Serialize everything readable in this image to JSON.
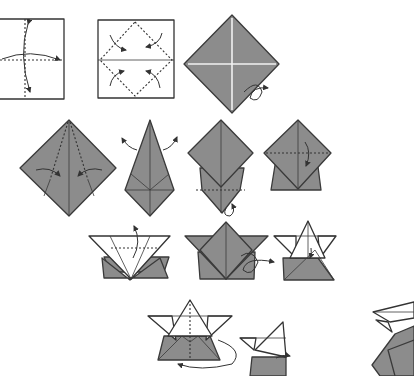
{
  "diagram": {
    "title": "",
    "colors": {
      "paper_front": "#8c8c8c",
      "paper_back": "#ffffff",
      "line": "#333333"
    },
    "steps": [
      {
        "id": 1,
        "shape": "square",
        "description": "Valley fold in half both ways and unfold",
        "symbols": [
          "valley-fold-line",
          "fold-unfold-arrow"
        ]
      },
      {
        "id": 2,
        "shape": "square",
        "description": "Fold four corners to center",
        "symbols": [
          "valley-fold-line",
          "fold-arrow"
        ]
      },
      {
        "id": 3,
        "shape": "diamond",
        "description": "Turn over",
        "symbols": [
          "turn-over-arrow"
        ]
      },
      {
        "id": 4,
        "shape": "diamond",
        "description": "Fold edges to center line",
        "symbols": [
          "valley-fold-line",
          "fold-arrow"
        ]
      },
      {
        "id": 5,
        "shape": "kite",
        "description": "Unfold flaps",
        "symbols": [
          "unfold-arrow"
        ]
      },
      {
        "id": 6,
        "shape": "diamond-stack",
        "description": "Turn over",
        "symbols": [
          "valley-fold-line",
          "turn-over-arrow"
        ]
      },
      {
        "id": 7,
        "shape": "diamond-on-trapezoid",
        "description": "Fold top point down",
        "symbols": [
          "valley-fold-line",
          "fold-arrow"
        ]
      },
      {
        "id": 8,
        "shape": "star-base",
        "description": "Fold flap up",
        "symbols": [
          "valley-fold-line",
          "fold-arrow"
        ]
      },
      {
        "id": 9,
        "shape": "star",
        "description": "Turn over",
        "symbols": [
          "turn-over-arrow"
        ]
      },
      {
        "id": 10,
        "shape": "hat",
        "description": "Fold point down",
        "symbols": [
          "fold-arrow"
        ]
      },
      {
        "id": 11,
        "shape": "hat",
        "description": "Fold in half behind",
        "symbols": [
          "valley-fold-line",
          "mountain-fold-arrow"
        ]
      },
      {
        "id": 12,
        "shape": "side-view",
        "description": "Side view, fold",
        "symbols": [
          "fold-arrow"
        ]
      },
      {
        "id": 13,
        "shape": "finished-partial",
        "description": "Result (partially visible)",
        "symbols": []
      }
    ]
  }
}
